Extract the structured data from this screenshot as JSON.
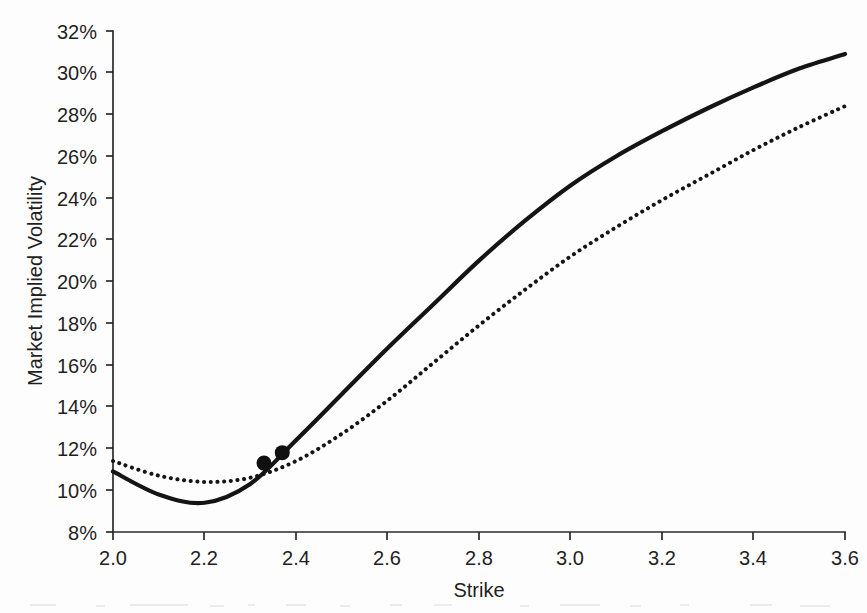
{
  "figure": {
    "background_color": "#fdfdfd",
    "ink_color": "#141414"
  },
  "axes": {
    "x_title": "Strike",
    "y_title": "Market Implied Volatility",
    "x_tick_labels": [
      "2.0",
      "2.2",
      "2.4",
      "2.6",
      "2.8",
      "3.0",
      "3.2",
      "3.4",
      "3.6"
    ],
    "y_tick_labels": [
      "8%",
      "10%",
      "12%",
      "14%",
      "16%",
      "18%",
      "20%",
      "22%",
      "24%",
      "26%",
      "28%",
      "30%",
      "32%"
    ]
  },
  "chart_data": {
    "type": "line",
    "title": "",
    "subtitle": "",
    "xlabel": "Strike",
    "ylabel": "Market Implied Volatility",
    "xlim": [
      2.0,
      3.6
    ],
    "ylim": [
      8,
      32
    ],
    "x_ticks": [
      2.0,
      2.2,
      2.4,
      2.6,
      2.8,
      3.0,
      3.2,
      3.4,
      3.6
    ],
    "y_ticks": [
      8,
      10,
      12,
      14,
      16,
      18,
      20,
      22,
      24,
      26,
      28,
      30,
      32
    ],
    "y_unit": "percent",
    "grid": false,
    "legend": false,
    "legend_position": "none",
    "x": [
      2.0,
      2.1,
      2.2,
      2.3,
      2.4,
      2.5,
      2.6,
      2.7,
      2.8,
      2.9,
      3.0,
      3.1,
      3.2,
      3.3,
      3.4,
      3.5,
      3.6
    ],
    "series": [
      {
        "name": "solid-curve",
        "style": "solid",
        "values": [
          10.9,
          9.8,
          9.4,
          10.3,
          12.4,
          14.6,
          16.8,
          18.9,
          21.0,
          22.9,
          24.6,
          26.0,
          27.2,
          28.3,
          29.3,
          30.2,
          30.9
        ]
      },
      {
        "name": "dotted-curve",
        "style": "dotted",
        "values": [
          11.4,
          10.7,
          10.4,
          10.6,
          11.4,
          12.7,
          14.3,
          16.1,
          17.9,
          19.6,
          21.2,
          22.6,
          23.9,
          25.1,
          26.3,
          27.4,
          28.4
        ]
      }
    ],
    "markers": [
      {
        "name": "market-quote-1",
        "x": 2.33,
        "y": 11.3
      },
      {
        "name": "market-quote-2",
        "x": 2.37,
        "y": 11.8
      }
    ]
  }
}
